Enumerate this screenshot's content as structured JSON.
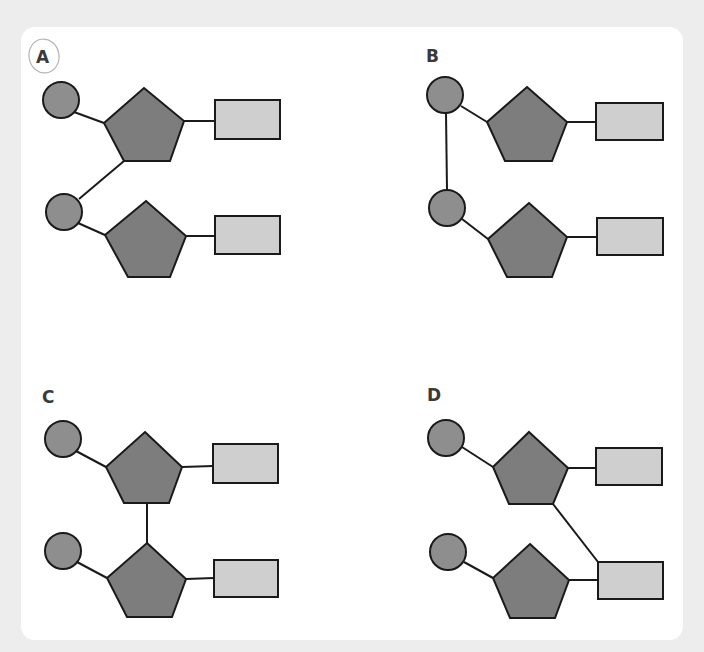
{
  "question": {
    "type": "multiple-choice-diagram",
    "subject": "nucleotide linkage (phosphate – sugar – base)"
  },
  "legend": {
    "circle": "phosphate",
    "pentagon": "sugar",
    "rectangle": "nitrogenous base"
  },
  "colors": {
    "background": "#ededed",
    "card": "#ffffff",
    "phosphate": "#8e8e8e",
    "sugar": "#7d7d7d",
    "base": "#cfcfcf",
    "outline": "#1a1a1a",
    "label": "#3a3a3a",
    "annotation": "#b5b5b5"
  },
  "options": [
    {
      "label": "A",
      "selected_annotation": true,
      "linkage": "top sugar (bottom vertex) bonded to lower phosphate"
    },
    {
      "label": "B",
      "selected_annotation": false,
      "linkage": "top phosphate bonded directly to lower phosphate"
    },
    {
      "label": "C",
      "selected_annotation": false,
      "linkage": "top sugar (bottom edge) bonded to lower sugar (top vertex)"
    },
    {
      "label": "D",
      "selected_annotation": false,
      "linkage": "top sugar (bottom-right vertex) bonded to lower base"
    }
  ]
}
